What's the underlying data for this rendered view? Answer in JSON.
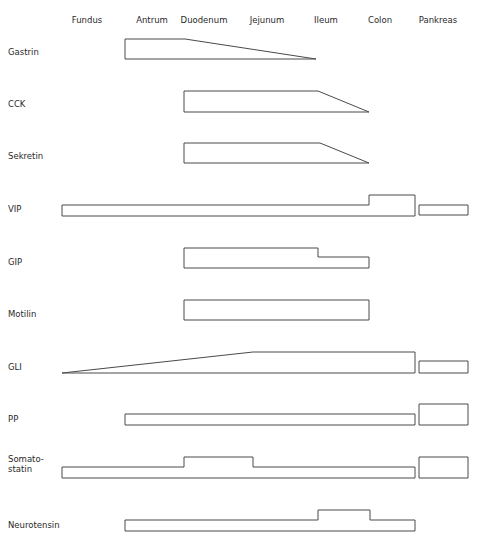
{
  "columns": [
    {
      "label": "Fundus",
      "x": 87
    },
    {
      "label": "Antrum",
      "x": 152
    },
    {
      "label": "Duodenum",
      "x": 204
    },
    {
      "label": "Jejunum",
      "x": 267
    },
    {
      "label": "Ileum",
      "x": 326
    },
    {
      "label": "Colon",
      "x": 380
    },
    {
      "label": "Pankreas",
      "x": 438
    }
  ],
  "rows": [
    {
      "label": "Gastrin",
      "y": 52,
      "shapes": [
        "125,39 185,39 316,59 125,59"
      ]
    },
    {
      "label": "CCK",
      "y": 104,
      "shapes": [
        "184,91 318,91 369,112 184,112"
      ]
    },
    {
      "label": "Sekretin",
      "y": 156,
      "shapes": [
        "184,143 320,143 369,163 184,163"
      ]
    },
    {
      "label": "VIP",
      "y": 209,
      "shapes": [
        "62,205 369,205 369,195 415,195 415,216 62,216",
        "419,205 468,205 468,215 419,215"
      ]
    },
    {
      "label": "GIP",
      "y": 262,
      "shapes": [
        "184,248 318,248 318,257 369,257 369,268 184,268"
      ]
    },
    {
      "label": "Motilin",
      "y": 314,
      "shapes": [
        "184,300 369,300 369,320 184,320"
      ]
    },
    {
      "label": "GLI",
      "y": 367,
      "shapes": [
        "62,373 253,352 415,352 415,373",
        "419,361 468,361 468,373 419,373"
      ]
    },
    {
      "label": "PP",
      "y": 419,
      "shapes": [
        "125,414 415,414 415,425 125,425",
        "419,404 468,404 468,425 419,425"
      ]
    },
    {
      "label": "Somato-\nstatin",
      "y": 464,
      "shapes": [
        "62,467 184,467 184,457 253,457 253,467 415,467 415,478 62,478",
        "419,457 468,457 468,478 419,478"
      ]
    },
    {
      "label": "Neurotensin",
      "y": 525,
      "shapes": [
        "125,520 318,520 318,510 370,510 370,520 415,520 415,531 125,531"
      ]
    }
  ],
  "colors": {
    "stroke": "#4a4a4a",
    "text": "#2a2a2a",
    "background": "#ffffff"
  }
}
